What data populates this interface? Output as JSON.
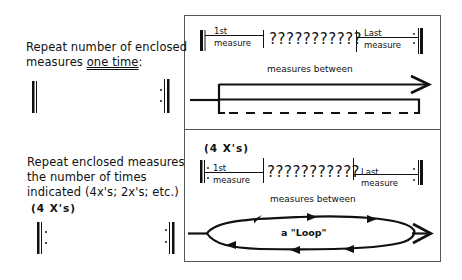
{
  "left_panel": {
    "single_repeat": {
      "line1": "Repeat number of enclosed",
      "line2_prefix": "measures ",
      "line2_emphasis": "one time",
      "line2_suffix": ":"
    },
    "multi_repeat": {
      "line1": "Repeat enclosed measures",
      "line2": "the number of times",
      "line3": "indicated (4x's; 2x's; etc.)",
      "count_label": "(4 X's)"
    }
  },
  "diagram_box": {
    "top_section": {
      "first_measure": {
        "top": "1st",
        "bottom": "measure"
      },
      "middle": "???????????",
      "last_measure": {
        "top": "Last",
        "bottom": "measure"
      },
      "caption": "measures between",
      "path_style": "arrow-with-dashed-return"
    },
    "bottom_section": {
      "count_label": "(4 X's)",
      "first_measure": {
        "top": "1st",
        "bottom": "measure"
      },
      "middle": "???????????",
      "last_measure": {
        "top": "Last",
        "bottom": "measure"
      },
      "caption": "measures between",
      "loop_label": "a \"Loop\""
    }
  },
  "colors": {
    "ink": "#111111",
    "background": "#ffffff",
    "box_border": "#555555"
  }
}
